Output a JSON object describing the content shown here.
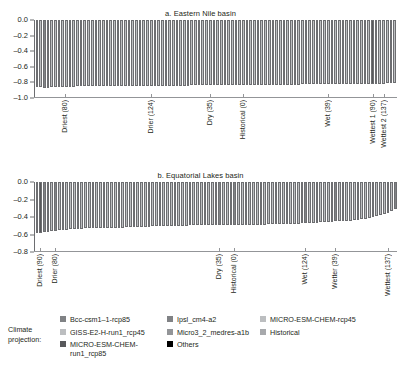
{
  "figure": {
    "panels": [
      {
        "key": "eastern_nile",
        "title": "a. Eastern Nile basin",
        "yticks": [
          "0.0",
          "-0.2",
          "-0.4",
          "-0.6",
          "-0.8",
          "-1.0"
        ],
        "ytick_values": [
          0.0,
          -0.2,
          -0.4,
          -0.6,
          -0.8,
          -1.0
        ],
        "ylim": [
          -1.0,
          0.0
        ],
        "category_labels": [
          {
            "text": "Driest (80)",
            "index": 8
          },
          {
            "text": "Drier (124)",
            "index": 31
          },
          {
            "text": "Dry (35)",
            "index": 47
          },
          {
            "text": "Historical (0)",
            "index": 56
          },
          {
            "text": "Wet (39)",
            "index": 79
          },
          {
            "text": "Wettest 1 (90)",
            "index": 91
          },
          {
            "text": "Wettest 2 (137)",
            "index": 94
          }
        ]
      },
      {
        "key": "equatorial_lakes",
        "title": "b. Equatorial Lakes basin",
        "yticks": [
          "0.0",
          "-0.2",
          "-0.4",
          "-0.6",
          "-0.8"
        ],
        "ytick_values": [
          0.0,
          -0.2,
          -0.4,
          -0.6,
          -0.8
        ],
        "ylim": [
          -0.8,
          0.0
        ],
        "category_labels": [
          {
            "text": "Driest (90)",
            "index": 1
          },
          {
            "text": "Drier (80)",
            "index": 5
          },
          {
            "text": "Dry (35)",
            "index": 49
          },
          {
            "text": "Historical (0)",
            "index": 53
          },
          {
            "text": "Wet (124)",
            "index": 72
          },
          {
            "text": "Wetter (39)",
            "index": 80
          },
          {
            "text": "Wettest (137)",
            "index": 94
          }
        ]
      }
    ]
  },
  "legend": {
    "title": "Climate\nprojection:",
    "columns": [
      [
        {
          "label": "Bcc-csm1–1-rcp85",
          "color": "#808285"
        },
        {
          "label": "GISS-E2-H-run1_rcp45",
          "color": "#bcbec0"
        },
        {
          "label": "MICRO-ESM-CHEM-\nrun1_rcp85",
          "color": "#58595b"
        }
      ],
      [
        {
          "label": "Ipsl_cm4-a2",
          "color": "#808285"
        },
        {
          "label": "Micro3_2_medres-a1b",
          "color": "#939598"
        },
        {
          "label": "Others",
          "color": "#000000"
        }
      ],
      [
        {
          "label": "MICRO-ESM-CHEM-rcp45",
          "color": "#bcbec0"
        },
        {
          "label": "Historical",
          "color": "#a7a9ac"
        }
      ]
    ]
  },
  "chart_data": {
    "type": "bar",
    "xlabel": "",
    "ylabel": "",
    "grid": false,
    "legend_position": "bottom",
    "panels": [
      {
        "name": "a. Eastern Nile basin",
        "ylim": [
          -1.0,
          0.0
        ],
        "yticks": [
          0.0,
          -0.2,
          -0.4,
          -0.6,
          -0.8,
          -1.0
        ],
        "n_bars": 97,
        "values": [
          -0.86,
          -0.86,
          -0.87,
          -0.87,
          -0.86,
          -0.86,
          -0.86,
          -0.86,
          -0.86,
          -0.86,
          -0.86,
          -0.85,
          -0.85,
          -0.85,
          -0.85,
          -0.85,
          -0.85,
          -0.85,
          -0.85,
          -0.85,
          -0.85,
          -0.85,
          -0.85,
          -0.85,
          -0.85,
          -0.84,
          -0.84,
          -0.84,
          -0.84,
          -0.84,
          -0.84,
          -0.84,
          -0.84,
          -0.84,
          -0.84,
          -0.84,
          -0.84,
          -0.84,
          -0.84,
          -0.84,
          -0.84,
          -0.84,
          -0.83,
          -0.83,
          -0.83,
          -0.83,
          -0.83,
          -0.83,
          -0.83,
          -0.83,
          -0.83,
          -0.83,
          -0.83,
          -0.83,
          -0.83,
          -0.83,
          -0.83,
          -0.83,
          -0.83,
          -0.83,
          -0.83,
          -0.83,
          -0.83,
          -0.83,
          -0.83,
          -0.83,
          -0.83,
          -0.83,
          -0.83,
          -0.83,
          -0.83,
          -0.83,
          -0.82,
          -0.82,
          -0.82,
          -0.82,
          -0.82,
          -0.82,
          -0.82,
          -0.82,
          -0.82,
          -0.82,
          -0.82,
          -0.82,
          -0.82,
          -0.82,
          -0.82,
          -0.82,
          -0.82,
          -0.82,
          -0.82,
          -0.82,
          -0.82,
          -0.82,
          -0.82,
          -0.81,
          -0.81,
          -0.81
        ],
        "bar_colors": [
          "#bcbec0",
          "#bcbec0",
          "#808285",
          "#808285",
          "#bcbec0",
          "#bcbec0",
          "#bcbec0",
          "#bcbec0",
          "#bcbec0",
          "#bcbec0",
          "#bcbec0",
          "#bcbec0",
          "#bcbec0",
          "#bcbec0",
          "#bcbec0",
          "#bcbec0",
          "#bcbec0",
          "#bcbec0",
          "#bcbec0",
          "#bcbec0",
          "#bcbec0",
          "#bcbec0",
          "#bcbec0",
          "#bcbec0",
          "#bcbec0",
          "#bcbec0",
          "#bcbec0",
          "#bcbec0",
          "#bcbec0",
          "#bcbec0",
          "#bcbec0",
          "#bcbec0",
          "#bcbec0",
          "#bcbec0",
          "#bcbec0",
          "#bcbec0",
          "#bcbec0",
          "#bcbec0",
          "#bcbec0",
          "#bcbec0",
          "#bcbec0",
          "#bcbec0",
          "#bcbec0",
          "#bcbec0",
          "#bcbec0",
          "#bcbec0",
          "#bcbec0",
          "#bcbec0",
          "#808285",
          "#bcbec0",
          "#bcbec0",
          "#bcbec0",
          "#bcbec0",
          "#bcbec0",
          "#bcbec0",
          "#bcbec0",
          "#bcbec0",
          "#bcbec0",
          "#bcbec0",
          "#bcbec0",
          "#bcbec0",
          "#bcbec0",
          "#bcbec0",
          "#bcbec0",
          "#bcbec0",
          "#bcbec0",
          "#bcbec0",
          "#bcbec0",
          "#bcbec0",
          "#bcbec0",
          "#bcbec0",
          "#bcbec0",
          "#bcbec0",
          "#bcbec0",
          "#bcbec0",
          "#bcbec0",
          "#bcbec0",
          "#bcbec0",
          "#bcbec0",
          "#bcbec0",
          "#bcbec0",
          "#bcbec0",
          "#bcbec0",
          "#bcbec0",
          "#bcbec0",
          "#bcbec0",
          "#bcbec0",
          "#bcbec0",
          "#bcbec0",
          "#bcbec0",
          "#bcbec0",
          "#58595b",
          "#bcbec0",
          "#bcbec0",
          "#bcbec0",
          "#bcbec0",
          "#bcbec0",
          "#bcbec0"
        ],
        "tick_labels": [
          "Driest (80)",
          "Drier (124)",
          "Dry (35)",
          "Historical (0)",
          "Wet (39)",
          "Wettest 1 (90)",
          "Wettest 2 (137)"
        ]
      },
      {
        "name": "b. Equatorial Lakes basin",
        "ylim": [
          -0.8,
          0.0
        ],
        "yticks": [
          0.0,
          -0.2,
          -0.4,
          -0.6,
          -0.8
        ],
        "n_bars": 97,
        "values": [
          -0.58,
          -0.58,
          -0.57,
          -0.57,
          -0.56,
          -0.56,
          -0.55,
          -0.55,
          -0.55,
          -0.54,
          -0.54,
          -0.54,
          -0.54,
          -0.53,
          -0.53,
          -0.53,
          -0.53,
          -0.53,
          -0.52,
          -0.52,
          -0.52,
          -0.52,
          -0.52,
          -0.52,
          -0.51,
          -0.51,
          -0.51,
          -0.51,
          -0.51,
          -0.51,
          -0.51,
          -0.5,
          -0.5,
          -0.5,
          -0.5,
          -0.5,
          -0.5,
          -0.5,
          -0.5,
          -0.5,
          -0.5,
          -0.49,
          -0.49,
          -0.49,
          -0.49,
          -0.49,
          -0.49,
          -0.49,
          -0.49,
          -0.49,
          -0.49,
          -0.49,
          -0.49,
          -0.49,
          -0.49,
          -0.49,
          -0.49,
          -0.49,
          -0.49,
          -0.49,
          -0.49,
          -0.49,
          -0.48,
          -0.48,
          -0.48,
          -0.48,
          -0.48,
          -0.48,
          -0.48,
          -0.48,
          -0.48,
          -0.47,
          -0.47,
          -0.47,
          -0.47,
          -0.47,
          -0.46,
          -0.46,
          -0.46,
          -0.46,
          -0.45,
          -0.45,
          -0.45,
          -0.44,
          -0.44,
          -0.43,
          -0.43,
          -0.42,
          -0.42,
          -0.41,
          -0.4,
          -0.39,
          -0.38,
          -0.37,
          -0.35,
          -0.33,
          -0.31
        ],
        "bar_colors": [
          "#58595b",
          "#58595b",
          "#808285",
          "#808285",
          "#bcbec0",
          "#808285",
          "#bcbec0",
          "#bcbec0",
          "#bcbec0",
          "#bcbec0",
          "#bcbec0",
          "#bcbec0",
          "#bcbec0",
          "#bcbec0",
          "#bcbec0",
          "#bcbec0",
          "#bcbec0",
          "#bcbec0",
          "#bcbec0",
          "#bcbec0",
          "#bcbec0",
          "#bcbec0",
          "#bcbec0",
          "#bcbec0",
          "#bcbec0",
          "#bcbec0",
          "#bcbec0",
          "#bcbec0",
          "#bcbec0",
          "#bcbec0",
          "#bcbec0",
          "#bcbec0",
          "#bcbec0",
          "#bcbec0",
          "#bcbec0",
          "#bcbec0",
          "#bcbec0",
          "#bcbec0",
          "#bcbec0",
          "#bcbec0",
          "#bcbec0",
          "#bcbec0",
          "#bcbec0",
          "#bcbec0",
          "#bcbec0",
          "#bcbec0",
          "#bcbec0",
          "#bcbec0",
          "#bcbec0",
          "#808285",
          "#bcbec0",
          "#bcbec0",
          "#bcbec0",
          "#808285",
          "#bcbec0",
          "#bcbec0",
          "#bcbec0",
          "#bcbec0",
          "#bcbec0",
          "#bcbec0",
          "#bcbec0",
          "#bcbec0",
          "#bcbec0",
          "#bcbec0",
          "#bcbec0",
          "#bcbec0",
          "#bcbec0",
          "#bcbec0",
          "#bcbec0",
          "#bcbec0",
          "#bcbec0",
          "#bcbec0",
          "#808285",
          "#bcbec0",
          "#bcbec0",
          "#bcbec0",
          "#bcbec0",
          "#bcbec0",
          "#bcbec0",
          "#bcbec0",
          "#808285",
          "#bcbec0",
          "#bcbec0",
          "#bcbec0",
          "#bcbec0",
          "#bcbec0",
          "#bcbec0",
          "#bcbec0",
          "#bcbec0",
          "#bcbec0",
          "#bcbec0",
          "#bcbec0",
          "#bcbec0",
          "#bcbec0",
          "#bcbec0",
          "#bcbec0",
          "#808285"
        ],
        "tick_labels": [
          "Driest (90)",
          "Drier (80)",
          "Dry (35)",
          "Historical (0)",
          "Wet (124)",
          "Wetter (39)",
          "Wettest (137)"
        ]
      }
    ]
  }
}
